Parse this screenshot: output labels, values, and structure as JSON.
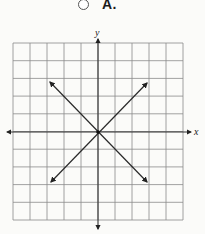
{
  "question": {
    "option": {
      "label": "A.",
      "selected": false
    }
  },
  "graph": {
    "x_axis_label": "x",
    "y_axis_label": "y",
    "grid": {
      "columns": 10,
      "rows": 10,
      "left": 13,
      "top": 43,
      "right": 183,
      "bottom": 220
    },
    "origin": [
      98,
      132
    ],
    "lines": [
      {
        "name": "line-positive-slope",
        "from": [
          51,
          182
        ],
        "to": [
          147,
          83
        ],
        "arrows": "both"
      },
      {
        "name": "line-negative-slope",
        "from": [
          50,
          82
        ],
        "to": [
          147,
          182
        ],
        "arrows": "both"
      }
    ],
    "colors": {
      "grid": "#8a8a8a",
      "axis": "#333333",
      "line": "#2a2a2a",
      "background": "#fbfbf9"
    }
  }
}
